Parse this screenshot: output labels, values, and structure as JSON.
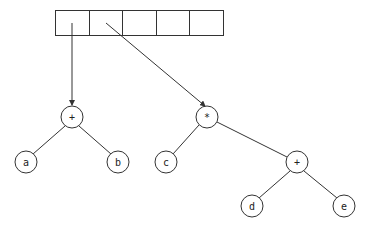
{
  "diagram": {
    "title": "",
    "array": {
      "cell_count": 5,
      "cells": [
        "",
        "",
        "",
        "",
        ""
      ]
    },
    "pointers": [
      {
        "from_cell": 0,
        "to_node": "root1"
      },
      {
        "from_cell": 1,
        "to_node": "root2"
      }
    ],
    "nodes": {
      "root1": {
        "label": "+"
      },
      "a": {
        "label": "a"
      },
      "b": {
        "label": "b"
      },
      "root2": {
        "label": "*"
      },
      "c": {
        "label": "c"
      },
      "plus2": {
        "label": "+"
      },
      "d": {
        "label": "d"
      },
      "e": {
        "label": "e"
      }
    },
    "edges": [
      {
        "from": "root1",
        "to": "a"
      },
      {
        "from": "root1",
        "to": "b"
      },
      {
        "from": "root2",
        "to": "c"
      },
      {
        "from": "root2",
        "to": "plus2"
      },
      {
        "from": "plus2",
        "to": "d"
      },
      {
        "from": "plus2",
        "to": "e"
      }
    ],
    "colors": {
      "stroke": "#333333",
      "background": "#ffffff",
      "text": "#222222"
    }
  }
}
